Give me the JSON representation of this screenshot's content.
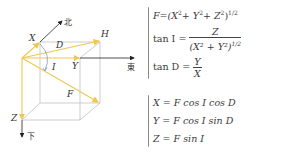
{
  "diagram": {
    "labels": {
      "north": "北",
      "east": "東",
      "down": "下",
      "x": "X",
      "y": "Y",
      "z": "Z",
      "h": "H",
      "d": "D",
      "i": "I",
      "f": "F"
    },
    "colors": {
      "vector": "#f0c850",
      "axis": "#222222",
      "box": "#b8b8b8",
      "angle_arc": "#7a9ad0"
    }
  },
  "equations_group1": {
    "f_lhs": "F",
    "f_rhs_open": "=(X",
    "f_p1": "+ Y",
    "f_p2": "+ Z",
    "f_close": ")",
    "sq": "2",
    "half": "1/2",
    "tanI_lhs": "tan I =",
    "tanI_num": "Z",
    "tanI_den": "(X² + Y²)",
    "tanI_den_exp": "1/2",
    "tanD_lhs": "tan D =",
    "tanD_num": "Y",
    "tanD_den": "X"
  },
  "equations_group2": {
    "eq_x": "X = F cos I cos D",
    "eq_y": "Y = F cos I sin D",
    "eq_z": "Z = F sin I"
  }
}
